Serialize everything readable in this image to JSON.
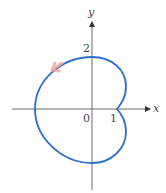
{
  "figure": {
    "axes": {
      "x_label": "x",
      "y_label": "y",
      "origin_label": "0",
      "x_tick_label": "1",
      "y_tick_label": "2"
    },
    "colors": {
      "curve": "#2a6fc9",
      "axis": "#6b6b6b",
      "arrow_highlight": "#f2a6a0"
    }
  }
}
